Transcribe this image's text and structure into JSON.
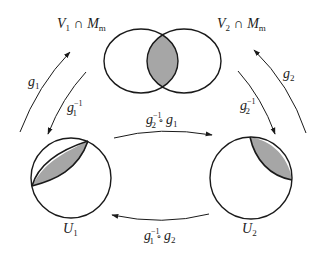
{
  "diagram": {
    "type": "commutative-chart-transition-maps",
    "colors": {
      "stroke": "#1a1a1a",
      "shade": "#a6a6a6",
      "background": "#ffffff"
    },
    "top_venn": {
      "left_label": {
        "main": "V",
        "sub": "1",
        "op": " ∩ ",
        "main2": "M",
        "sub2": "m"
      },
      "right_label": {
        "main": "V",
        "sub": "2",
        "op": " ∩ ",
        "main2": "M",
        "sub2": "m"
      }
    },
    "bottom_sets": {
      "left": {
        "main": "U",
        "sub": "1"
      },
      "right": {
        "main": "U",
        "sub": "2"
      }
    },
    "arrows": {
      "g1": {
        "main": "g",
        "sub": "1"
      },
      "g1_inv": {
        "main": "g",
        "sub": "1",
        "sup": "−1"
      },
      "g2": {
        "main": "g",
        "sub": "2"
      },
      "g2_inv": {
        "main": "g",
        "sub": "2",
        "sup": "−1"
      },
      "top_composite": {
        "a_main": "g",
        "a_sub": "2",
        "a_sup": "−1",
        "op": " ∘ ",
        "b_main": "g",
        "b_sub": "1"
      },
      "bottom_composite": {
        "a_main": "g",
        "a_sub": "1",
        "a_sup": "−1",
        "op": " ∘ ",
        "b_main": "g",
        "b_sub": "2"
      }
    }
  }
}
